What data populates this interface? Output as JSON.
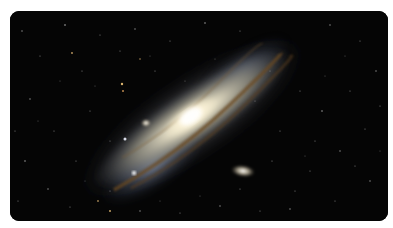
{
  "image": {
    "subject": "Andromeda Galaxy",
    "alt": "Spiral galaxy with companion galaxies against a star field",
    "colors": {
      "background": "#ffffff",
      "space": "#050505",
      "core": "#fffbe8",
      "disk": "#d8cfb4",
      "dust_lane": "#6b4a22",
      "outer_arm": "#a9b8d6"
    }
  }
}
